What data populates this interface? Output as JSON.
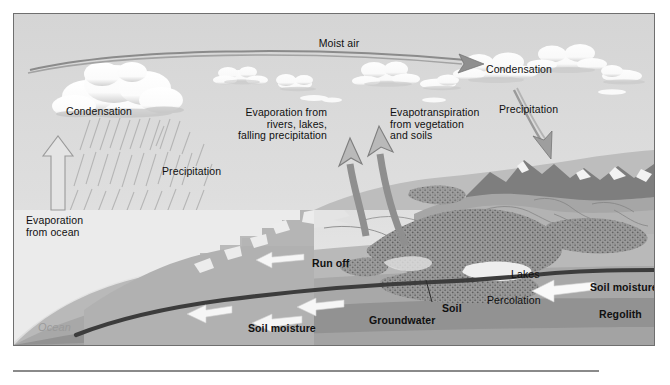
{
  "figure": {
    "type": "labeled cross-section diagram",
    "frame_border_color": "#6f6f6f",
    "background_color": "#d9d9d9"
  },
  "palette": {
    "sky": "#dcdcdc",
    "sky_low": "#e8e8e8",
    "ocean": "#eeeeee",
    "cloud_white": "#ffffff",
    "cloud_shadow": "#c8c8c8",
    "land_light": "#c2c2c2",
    "land_mid": "#ababab",
    "land_dark": "#8f8f8f",
    "mountain_dark": "#7b7b7b",
    "regolith": "#b5b5b5",
    "bedrock": "#9d9d9d",
    "water_table": "#3a3a3a",
    "arrow_gray": "#8d8d8d",
    "arrow_white": "#f7f7f7",
    "text": "#101010",
    "ocean_text": "#9a9a9a"
  },
  "labels": {
    "moist_air": "Moist air",
    "condensation_left": "Condensation",
    "condensation_right": "Condensation",
    "precipitation_left": "Precipitation",
    "precipitation_right": "Precipitation",
    "evaporation_rivers": "Evaporation from\nrivers, lakes,\nfalling precipitation",
    "evapotranspiration": "Evapotranspiration\nfrom vegetation\nand soils",
    "evaporation_ocean": "Evaporation\nfrom ocean",
    "ocean": "Ocean",
    "run_off": "Run off",
    "soil_moisture_left": "Soil moisture",
    "soil_moisture_right": "Soil moisture",
    "groundwater": "Groundwater",
    "soil": "Soil",
    "percolation": "Percolation",
    "lakes": "Lakes",
    "regolith": "Regolith",
    "bedrock": "Bedrock"
  },
  "arrows": [
    {
      "name": "moist-air-arrow",
      "style": "gray-outline-curved",
      "direction": "left-to-right",
      "label": "Moist air"
    },
    {
      "name": "evaporation-ocean-arrow",
      "style": "white-outline-straight",
      "direction": "up",
      "label": "Evaporation from ocean"
    },
    {
      "name": "evaporation-rivers-arrow",
      "style": "gray-curved",
      "direction": "up",
      "label": "Evaporation from rivers, lakes, falling precipitation"
    },
    {
      "name": "evapotranspiration-arrow",
      "style": "gray-curved",
      "direction": "up",
      "label": "Evapotranspiration from vegetation and soils"
    },
    {
      "name": "precipitation-right-arrow",
      "style": "gray-outline-curved",
      "direction": "down-right",
      "label": "Precipitation"
    },
    {
      "name": "run-off-arrow",
      "style": "white-solid",
      "direction": "left",
      "label": "Run off"
    },
    {
      "name": "soil-moisture-arrow-left",
      "style": "white-solid",
      "direction": "left",
      "label": "Soil moisture"
    },
    {
      "name": "groundwater-arrow-1",
      "style": "white-solid",
      "direction": "left",
      "label": "Groundwater"
    },
    {
      "name": "groundwater-arrow-2",
      "style": "white-solid",
      "direction": "left",
      "label": "Groundwater"
    },
    {
      "name": "percolation-arrow",
      "style": "white-solid",
      "direction": "left",
      "label": "Percolation"
    }
  ],
  "layers": [
    {
      "name": "ocean",
      "label": "Ocean"
    },
    {
      "name": "soil",
      "label": "Soil"
    },
    {
      "name": "regolith",
      "label": "Regolith"
    },
    {
      "name": "bedrock",
      "label": "Bedrock"
    }
  ]
}
